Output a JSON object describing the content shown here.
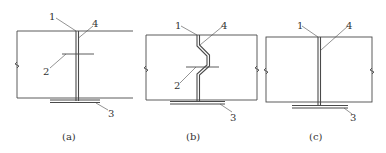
{
  "figure": {
    "panels": [
      {
        "id": "a",
        "caption": "(a)",
        "labels": {
          "n1": "1",
          "n2": "2",
          "n3": "3",
          "n4": "4"
        },
        "description": "Straight vertical joint with horizontal cross member"
      },
      {
        "id": "b",
        "caption": "(b)",
        "labels": {
          "n1": "1",
          "n2": "2",
          "n3": "3",
          "n4": "4"
        },
        "description": "Zigzag (offset) vertical joint with horizontal cross member"
      },
      {
        "id": "c",
        "caption": "(c)",
        "labels": {
          "n1": "1",
          "n3": "3",
          "n4": "4"
        },
        "description": "Straight vertical joint without cross member"
      }
    ],
    "colors": {
      "line": "#4a4a4a",
      "fill": "#ffffff"
    }
  }
}
